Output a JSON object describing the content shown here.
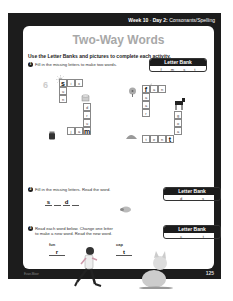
{
  "header": {
    "week": "Week 10",
    "day": "Day 2:",
    "subject": "Consonants/Spelling"
  },
  "title": "Two-Way Words",
  "instructions": "Use the Letter Banks and pictures to complete each activity.",
  "activity1": {
    "number": "1",
    "prompt": "Fill in the missing letters to make two words.",
    "letter_bank": {
      "label": "Letter Bank",
      "letters": [
        "f",
        "m",
        "s",
        "t"
      ]
    },
    "left_puzzle": {
      "hint_number": "6",
      "across_top": [
        "s",
        "i",
        "x"
      ],
      "down_left": [
        "u",
        "n"
      ],
      "down_right": [
        "d",
        "r",
        "u"
      ],
      "across_bottom": [
        "j",
        "a",
        "m"
      ],
      "pictures": [
        "sun-picture",
        "drum-picture",
        "jam-jar-picture"
      ]
    },
    "right_puzzle": {
      "across_top": [
        "f",
        "a",
        "n"
      ],
      "down_left": [
        "a",
        "a",
        "r"
      ],
      "down_right": [
        "g",
        "o",
        "a"
      ],
      "across_bottom": [
        "t",
        "e",
        "n",
        "t"
      ],
      "pictures": [
        "fan-picture",
        "goat-picture",
        "tent-picture",
        "farm-picture"
      ]
    }
  },
  "activity2": {
    "number": "2",
    "prompt": "Fill in the missing letters. Read the word.",
    "letter_bank": {
      "label": "Letter Bank",
      "letters": [
        "d",
        "s"
      ]
    },
    "word_letters": [
      "s",
      "",
      "d",
      ""
    ],
    "picture": "seed-picture"
  },
  "activity3": {
    "number": "3",
    "prompt_line1": "Read each word below. Change one letter",
    "prompt_line2": "to make a new word. Read the new word.",
    "letter_bank": {
      "label": "Letter Bank",
      "letters": [
        "c",
        "t"
      ]
    },
    "words": [
      {
        "given": "fun",
        "answer": "r",
        "picture": "runner-picture"
      },
      {
        "given": "cap",
        "answer": "t",
        "picture": "cat-picture"
      }
    ]
  },
  "footer": {
    "left": "Evan-Moor",
    "page": "125"
  }
}
